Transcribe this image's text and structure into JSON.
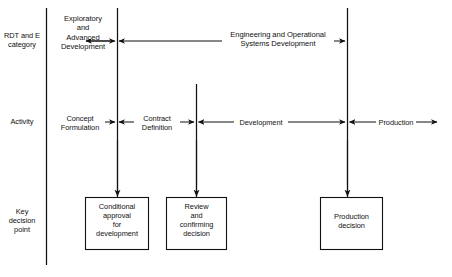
{
  "diagram": {
    "line_color": "#111111",
    "text_color": "#111111",
    "background": "#ffffff"
  },
  "row_labels": [
    {
      "name": "rdt-and-e-category",
      "text": "RDT and E\ncategory"
    },
    {
      "name": "activity",
      "text": "Activity"
    },
    {
      "name": "key-decision-point",
      "text": "Key\ndecision\npoint"
    }
  ],
  "rdte_row": {
    "phases": [
      {
        "name": "exploratory-and-advanced-development",
        "text": "Exploratory\nand\nAdvanced\nDevelopment"
      },
      {
        "name": "engineering-and-operational-systems-development",
        "text": "Engineering and Operational\nSystems Development"
      }
    ]
  },
  "activity_row": {
    "phases": [
      {
        "name": "concept-formulation",
        "text": "Concept\nFormulation"
      },
      {
        "name": "contract-definition",
        "text": "Contract\nDefinition"
      },
      {
        "name": "development",
        "text": "Development"
      },
      {
        "name": "production",
        "text": "Production"
      }
    ]
  },
  "decision_boxes": [
    {
      "name": "conditional-approval-for-development",
      "text": "Conditional\napproval\nfor\ndevelopment"
    },
    {
      "name": "review-and-confirming-decision",
      "text": "Review\nand\nconfirming\ndecision"
    },
    {
      "name": "production-decision",
      "text": "Production\ndecision"
    }
  ]
}
